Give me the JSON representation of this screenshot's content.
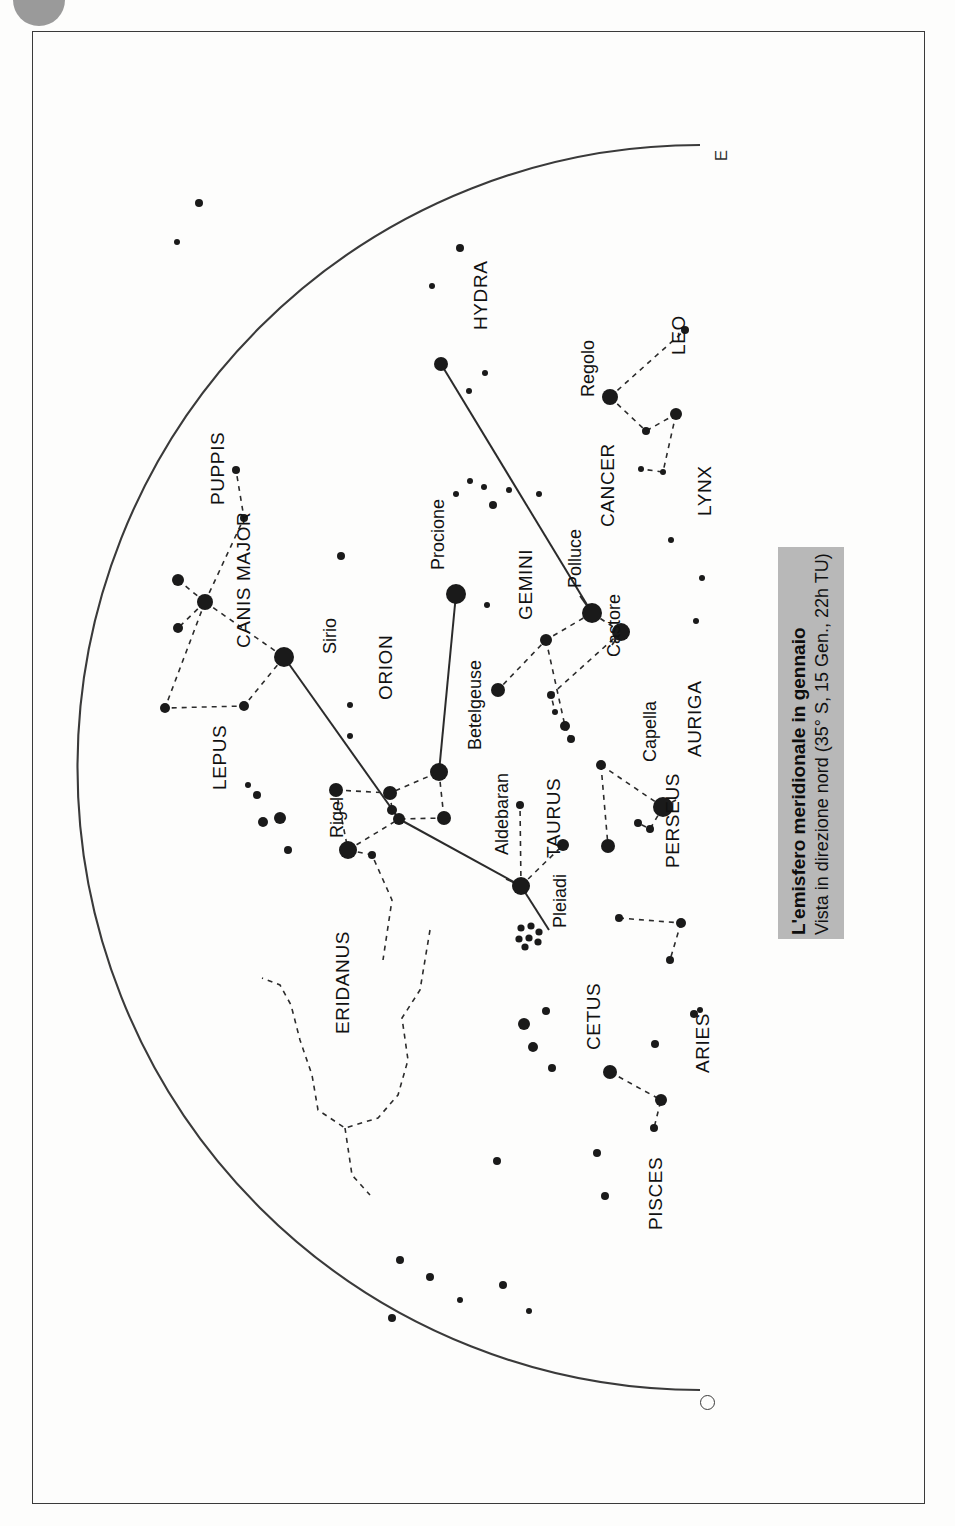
{
  "page": {
    "badge": "corner-dot"
  },
  "caption": {
    "title": "L'emisfero meridionale in gennaio",
    "subtitle": "Vista in direzione nord (35° S, 15 Gen., 22h TU)"
  },
  "compass": {
    "east_label": "E",
    "west_label": "O"
  },
  "chart_data": {
    "type": "scatter",
    "title": "L'emisfero meridionale in gennaio",
    "subtitle": "Vista in direzione nord (35° S, 15 Gen., 22h TU)",
    "xlabel": "",
    "ylabel": "",
    "projection": "half-sky-dome",
    "grid": false,
    "legend": false,
    "horizon": {
      "type": "arc",
      "east_end": [
        700,
        145
      ],
      "west_end": [
        700,
        1390
      ],
      "description": "semicircular horizon arc, flat side on right (vertical), bulging left"
    },
    "constellations": [
      {
        "name": "HYDRA",
        "label_x": 470,
        "label_y": 330
      },
      {
        "name": "LEO",
        "label_x": 668,
        "label_y": 355
      },
      {
        "name": "CANCER",
        "label_x": 597,
        "label_y": 527
      },
      {
        "name": "LYNX",
        "label_x": 694,
        "label_y": 516
      },
      {
        "name": "GEMINI",
        "label_x": 515,
        "label_y": 620
      },
      {
        "name": "PUPPIS",
        "label_x": 207,
        "label_y": 505
      },
      {
        "name": "CANIS MAJOR",
        "label_x": 233,
        "label_y": 648
      },
      {
        "name": "ORION",
        "label_x": 375,
        "label_y": 700
      },
      {
        "name": "LEPUS",
        "label_x": 209,
        "label_y": 790
      },
      {
        "name": "TAURUS",
        "label_x": 543,
        "label_y": 858
      },
      {
        "name": "AURIGA",
        "label_x": 684,
        "label_y": 757
      },
      {
        "name": "PERSEUS",
        "label_x": 662,
        "label_y": 868
      },
      {
        "name": "ERIDANUS",
        "label_x": 332,
        "label_y": 1034
      },
      {
        "name": "CETUS",
        "label_x": 583,
        "label_y": 1050
      },
      {
        "name": "ARIES",
        "label_x": 692,
        "label_y": 1073
      },
      {
        "name": "PISCES",
        "label_x": 645,
        "label_y": 1230
      }
    ],
    "named_stars": [
      {
        "name": "Regolo",
        "label_x": 578,
        "label_y": 397,
        "star_x": 610,
        "star_y": 397,
        "mag_size": 15
      },
      {
        "name": "Polluce",
        "label_x": 565,
        "label_y": 588,
        "star_x": 592,
        "star_y": 613,
        "mag_size": 14
      },
      {
        "name": "Castore",
        "label_x": 604,
        "label_y": 657,
        "star_x": 621,
        "star_y": 632,
        "mag_size": 14
      },
      {
        "name": "Procione",
        "label_x": 428,
        "label_y": 570,
        "star_x": 456,
        "star_y": 594,
        "mag_size": 15
      },
      {
        "name": "Sirio",
        "label_x": 320,
        "label_y": 654,
        "star_x": 284,
        "star_y": 657,
        "mag_size": 16
      },
      {
        "name": "Betelgeuse",
        "label_x": 465,
        "label_y": 750,
        "star_x": 439,
        "star_y": 772,
        "mag_size": 14
      },
      {
        "name": "Rigel",
        "label_x": 327,
        "label_y": 838,
        "star_x": 348,
        "star_y": 850,
        "mag_size": 15
      },
      {
        "name": "Aldebaran",
        "label_x": 492,
        "label_y": 855,
        "star_x": 521,
        "star_y": 886,
        "mag_size": 14
      },
      {
        "name": "Capella",
        "label_x": 640,
        "label_y": 762,
        "star_x": 663,
        "star_y": 807,
        "mag_size": 14
      },
      {
        "name": "Pleiadi",
        "label_x": 550,
        "label_y": 928,
        "star_x": 527,
        "star_y": 936,
        "mag_size": 0
      }
    ],
    "stars": [
      {
        "x": 460,
        "y": 248,
        "r": 4
      },
      {
        "x": 432,
        "y": 286,
        "r": 3
      },
      {
        "x": 441,
        "y": 364,
        "r": 7
      },
      {
        "x": 485,
        "y": 373,
        "r": 3
      },
      {
        "x": 469,
        "y": 391,
        "r": 3
      },
      {
        "x": 470,
        "y": 481,
        "r": 3
      },
      {
        "x": 484,
        "y": 487,
        "r": 3
      },
      {
        "x": 456,
        "y": 494,
        "r": 3
      },
      {
        "x": 493,
        "y": 505,
        "r": 4
      },
      {
        "x": 509,
        "y": 490,
        "r": 3
      },
      {
        "x": 539,
        "y": 494,
        "r": 3
      },
      {
        "x": 610,
        "y": 397,
        "r": 8
      },
      {
        "x": 676,
        "y": 414,
        "r": 6
      },
      {
        "x": 646,
        "y": 431,
        "r": 4
      },
      {
        "x": 685,
        "y": 330,
        "r": 4
      },
      {
        "x": 641,
        "y": 469,
        "r": 3
      },
      {
        "x": 663,
        "y": 472,
        "r": 3
      },
      {
        "x": 671,
        "y": 540,
        "r": 3
      },
      {
        "x": 702,
        "y": 578,
        "r": 3
      },
      {
        "x": 696,
        "y": 621,
        "r": 3
      },
      {
        "x": 456,
        "y": 594,
        "r": 10
      },
      {
        "x": 487,
        "y": 605,
        "r": 3
      },
      {
        "x": 592,
        "y": 613,
        "r": 10
      },
      {
        "x": 621,
        "y": 632,
        "r": 9
      },
      {
        "x": 546,
        "y": 640,
        "r": 6
      },
      {
        "x": 498,
        "y": 690,
        "r": 7
      },
      {
        "x": 551,
        "y": 695,
        "r": 4
      },
      {
        "x": 555,
        "y": 712,
        "r": 3
      },
      {
        "x": 284,
        "y": 657,
        "r": 10
      },
      {
        "x": 205,
        "y": 602,
        "r": 8
      },
      {
        "x": 178,
        "y": 580,
        "r": 6
      },
      {
        "x": 178,
        "y": 628,
        "r": 5
      },
      {
        "x": 165,
        "y": 708,
        "r": 5
      },
      {
        "x": 244,
        "y": 706,
        "r": 5
      },
      {
        "x": 236,
        "y": 470,
        "r": 4
      },
      {
        "x": 244,
        "y": 518,
        "r": 4
      },
      {
        "x": 341,
        "y": 556,
        "r": 4
      },
      {
        "x": 350,
        "y": 705,
        "r": 3
      },
      {
        "x": 350,
        "y": 736,
        "r": 3
      },
      {
        "x": 390,
        "y": 793,
        "r": 7
      },
      {
        "x": 336,
        "y": 790,
        "r": 7
      },
      {
        "x": 392,
        "y": 810,
        "r": 5
      },
      {
        "x": 399,
        "y": 819,
        "r": 6
      },
      {
        "x": 439,
        "y": 772,
        "r": 9
      },
      {
        "x": 444,
        "y": 818,
        "r": 7
      },
      {
        "x": 348,
        "y": 850,
        "r": 9
      },
      {
        "x": 372,
        "y": 855,
        "r": 4
      },
      {
        "x": 280,
        "y": 818,
        "r": 6
      },
      {
        "x": 263,
        "y": 822,
        "r": 5
      },
      {
        "x": 257,
        "y": 795,
        "r": 4
      },
      {
        "x": 248,
        "y": 785,
        "r": 3
      },
      {
        "x": 288,
        "y": 850,
        "r": 4
      },
      {
        "x": 521,
        "y": 886,
        "r": 9
      },
      {
        "x": 520,
        "y": 805,
        "r": 4
      },
      {
        "x": 563,
        "y": 845,
        "r": 6
      },
      {
        "x": 601,
        "y": 765,
        "r": 5
      },
      {
        "x": 608,
        "y": 846,
        "r": 7
      },
      {
        "x": 663,
        "y": 807,
        "r": 10
      },
      {
        "x": 638,
        "y": 823,
        "r": 4
      },
      {
        "x": 650,
        "y": 829,
        "r": 4
      },
      {
        "x": 565,
        "y": 726,
        "r": 5
      },
      {
        "x": 571,
        "y": 739,
        "r": 4
      },
      {
        "x": 619,
        "y": 918,
        "r": 4
      },
      {
        "x": 681,
        "y": 923,
        "r": 5
      },
      {
        "x": 670,
        "y": 960,
        "r": 4
      },
      {
        "x": 597,
        "y": 1153,
        "r": 4
      },
      {
        "x": 605,
        "y": 1196,
        "r": 4
      },
      {
        "x": 497,
        "y": 1161,
        "r": 4
      },
      {
        "x": 524,
        "y": 1024,
        "r": 6
      },
      {
        "x": 533,
        "y": 1047,
        "r": 5
      },
      {
        "x": 552,
        "y": 1068,
        "r": 4
      },
      {
        "x": 546,
        "y": 1011,
        "r": 4
      },
      {
        "x": 610,
        "y": 1072,
        "r": 7
      },
      {
        "x": 661,
        "y": 1100,
        "r": 6
      },
      {
        "x": 655,
        "y": 1044,
        "r": 4
      },
      {
        "x": 694,
        "y": 1014,
        "r": 4
      },
      {
        "x": 700,
        "y": 1010,
        "r": 3
      },
      {
        "x": 654,
        "y": 1128,
        "r": 4
      },
      {
        "x": 503,
        "y": 1285,
        "r": 4
      },
      {
        "x": 529,
        "y": 1311,
        "r": 3
      },
      {
        "x": 460,
        "y": 1300,
        "r": 3
      },
      {
        "x": 430,
        "y": 1277,
        "r": 4
      },
      {
        "x": 400,
        "y": 1260,
        "r": 4
      },
      {
        "x": 392,
        "y": 1318,
        "r": 4
      },
      {
        "x": 199,
        "y": 203,
        "r": 4
      },
      {
        "x": 177,
        "y": 242,
        "r": 3
      }
    ],
    "pleiades_cluster": {
      "center_x": 527,
      "center_y": 936,
      "members": [
        {
          "dx": -6,
          "dy": -8
        },
        {
          "dx": 4,
          "dy": -10
        },
        {
          "dx": 12,
          "dy": -4
        },
        {
          "dx": -8,
          "dy": 3
        },
        {
          "dx": 2,
          "dy": 2
        },
        {
          "dx": 11,
          "dy": 6
        },
        {
          "dx": -2,
          "dy": 11
        }
      ]
    }
  }
}
